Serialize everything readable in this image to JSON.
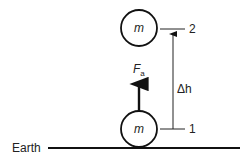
{
  "diagram": {
    "ground_label": "Earth",
    "mass_top_label": "m",
    "mass_bottom_label": "m",
    "force_label": "F",
    "force_subscript": "a",
    "height_label": "Δh",
    "level_top": "2",
    "level_bottom": "1",
    "colors": {
      "stroke": "#111111",
      "background": "#ffffff"
    }
  }
}
